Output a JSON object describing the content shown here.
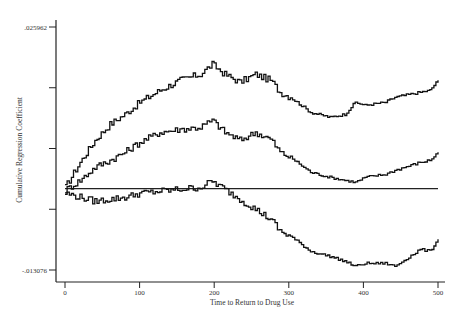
{
  "header_fragment": "",
  "chart_data": {
    "type": "line",
    "style": "step",
    "title": "",
    "xlabel": "Time to Return to Drug Use",
    "ylabel": "Cumulative Regression Coefficient",
    "xlim": [
      0,
      500
    ],
    "ylim": [
      -0.013076,
      0.025962
    ],
    "x_ticks": [
      0,
      100,
      200,
      300,
      400,
      500
    ],
    "y_tick_labels": [
      ".025962",
      "",
      "",
      "",
      "-.013076"
    ],
    "y_ticks": [
      0.025962,
      0.016203,
      0.006443,
      -0.003317,
      -0.013076
    ],
    "reference_line": {
      "y": 0,
      "label": "zero line"
    },
    "grid": false,
    "legend": null,
    "x": [
      0,
      20,
      40,
      60,
      80,
      100,
      127,
      154,
      181,
      197,
      214,
      234,
      255,
      275,
      288,
      302,
      329,
      355,
      375,
      389,
      402,
      429,
      442,
      476,
      489,
      500
    ],
    "series": [
      {
        "name": "upper confidence band",
        "values": [
          0.000207,
          0.004225,
          0.00776,
          0.010331,
          0.011938,
          0.013866,
          0.015795,
          0.017402,
          0.018366,
          0.019973,
          0.018366,
          0.017081,
          0.018366,
          0.017402,
          0.015474,
          0.01467,
          0.012259,
          0.011456,
          0.011938,
          0.013866,
          0.013384,
          0.013866,
          0.01467,
          0.015474,
          0.015795,
          0.017402
        ]
      },
      {
        "name": "estimate",
        "values": [
          -0.000275,
          0.001332,
          0.003421,
          0.004546,
          0.005831,
          0.007438,
          0.009045,
          0.009527,
          0.009849,
          0.010974,
          0.009045,
          0.00776,
          0.009045,
          0.007921,
          0.005831,
          0.005028,
          0.002617,
          0.001814,
          0.001332,
          0.00101,
          0.001814,
          0.002296,
          0.002939,
          0.004225,
          0.004546,
          0.005831
        ]
      },
      {
        "name": "lower confidence band",
        "values": [
          -0.000757,
          -0.0014,
          -0.002043,
          -0.001721,
          -0.0014,
          -0.000757,
          -0.000436,
          -0.000114,
          0.000207,
          0.001171,
          -0.000114,
          -0.001721,
          -0.003328,
          -0.004935,
          -0.006863,
          -0.007667,
          -0.010077,
          -0.010881,
          -0.011684,
          -0.012488,
          -0.012006,
          -0.012006,
          -0.012488,
          -0.009756,
          -0.010077,
          -0.008149
        ]
      }
    ]
  }
}
